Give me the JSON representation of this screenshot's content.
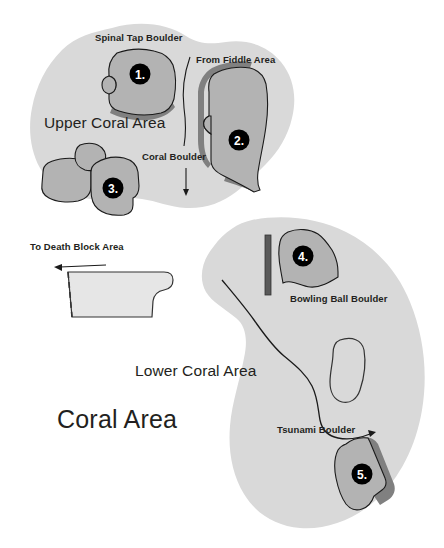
{
  "map": {
    "title": "Coral Area",
    "areas": [
      {
        "id": "upper",
        "label": "Upper Coral Area"
      },
      {
        "id": "lower",
        "label": "Lower Coral Area"
      }
    ],
    "boulders": [
      {
        "number": "1.",
        "label": "Spinal Tap Boulder"
      },
      {
        "number": "2.",
        "label": "From Fiddle Area"
      },
      {
        "number": "3.",
        "label": "Coral Boulder"
      },
      {
        "number": "4.",
        "label": "Bowling Ball Boulder"
      },
      {
        "number": "5.",
        "label": "Tsunami Boulder"
      }
    ],
    "directions": [
      {
        "label": "To Death Block Area"
      }
    ],
    "colors": {
      "area_fill": "#d9d9d9",
      "boulder_fill": "#b3b3b3",
      "boulder_shadow": "#808080",
      "outline": "#1a1a1a",
      "marker_fill": "#000000",
      "marker_text": "#ffffff",
      "background": "#ffffff",
      "bar": "#595959"
    }
  }
}
